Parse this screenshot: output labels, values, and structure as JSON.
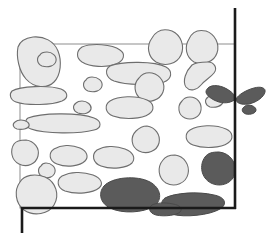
{
  "figure": {
    "canvas": {
      "width": 275,
      "height": 245,
      "background": "#ffffff"
    },
    "colors": {
      "clast_light_fill": "#e9e9e9",
      "clast_light_outline": "#6e6e6e",
      "clast_dark_fill": "#5b5b5b",
      "clast_dark_outline": "#4a4a4a",
      "frame_stroke": "#8d8d8d",
      "axis_stroke": "#1a1a1a"
    },
    "frame": {
      "label": "inner sample frame",
      "x": 20,
      "y": 44,
      "width": 215,
      "height": 164,
      "stroke_width": 1
    },
    "axes": [
      {
        "name": "vertical-axis-right",
        "orientation": "vertical",
        "x": 235,
        "y1": 8,
        "y2": 209,
        "stroke_width": 2.6
      },
      {
        "name": "horizontal-axis-bottom",
        "orientation": "horizontal",
        "y": 208,
        "x1": 21,
        "x2": 236,
        "stroke_width": 2.6
      },
      {
        "name": "vertical-axis-left-tail",
        "orientation": "vertical",
        "x": 22,
        "y1": 207,
        "y2": 233,
        "stroke_width": 2.6
      }
    ],
    "clasts": {
      "count_total": 31,
      "count_light": 25,
      "count_dark": 6,
      "light": [
        {
          "id": "clast-l01",
          "note": "large rounded, upper left, overlaps frame corner",
          "path": "M18,47 C16,57 19,71 26,79 C34,88 47,89 54,82 C61,75 62,61 58,51 C54,41 44,36 33,37 C25,38 20,41 18,47 Z"
        },
        {
          "id": "clast-l02",
          "note": "elongate oval upper centre-left",
          "path": "M82,47 C76,51 76,58 82,62 C90,67 106,68 116,64 C124,61 126,54 120,50 C112,44 92,43 82,47 Z"
        },
        {
          "id": "clast-l03",
          "note": "long bar, upper middle",
          "path": "M110,66 C104,70 106,78 114,81 C126,85 152,86 164,82 C172,79 173,71 166,67 C155,61 122,61 110,66 Z"
        },
        {
          "id": "clast-l04",
          "note": "round, top centre-right",
          "path": "M152,38 C146,46 148,57 156,62 C165,67 177,64 181,55 C185,46 181,35 172,31 C163,28 156,31 152,38 Z"
        },
        {
          "id": "clast-l05",
          "note": "round, top right",
          "path": "M189,39 C184,47 186,57 194,62 C203,66 214,62 217,53 C220,44 215,34 206,31 C197,29 192,32 189,39 Z"
        },
        {
          "id": "clast-l06",
          "note": "small pebble centre-left upper",
          "path": "M86,80 C82,83 83,89 88,91 C94,93 101,91 102,86 C103,81 98,77 92,77 C89,77 87,78 86,80 Z"
        },
        {
          "id": "clast-l07",
          "note": "wavy S-shape, right upper",
          "path": "M192,65 C186,71 182,81 186,87 C190,92 197,90 201,85 C205,80 210,78 214,73 C218,68 214,62 208,62 C203,62 196,62 192,65 Z"
        },
        {
          "id": "clast-l08",
          "note": "rounded, right of centre",
          "path": "M139,78 C133,84 134,94 141,99 C149,104 160,100 163,92 C166,84 161,75 152,73 C146,72 142,74 139,78 Z"
        },
        {
          "id": "clast-l09",
          "note": "flat lens left margin",
          "path": "M12,91 C9,94 10,100 16,102 C28,106 52,105 62,101 C69,98 68,92 61,89 C49,85 20,86 12,91 Z"
        },
        {
          "id": "clast-l10",
          "note": "oval, centre band",
          "path": "M110,101 C104,105 105,113 113,116 C124,120 142,119 149,114 C155,110 154,103 147,100 C136,95 118,96 110,101 Z"
        },
        {
          "id": "clast-l11",
          "note": "small round, right band",
          "path": "M182,101 C177,106 178,115 185,118 C192,121 200,117 201,110 C202,103 197,97 190,97 C186,97 184,98 182,101 Z"
        },
        {
          "id": "clast-l12",
          "note": "very long thin bar, left-centre",
          "path": "M28,118 C24,121 25,127 31,129 C45,134 79,134 94,130 C102,128 102,121 94,118 C78,112 40,113 28,118 Z"
        },
        {
          "id": "clast-l13",
          "note": "rounded blob, mid-right",
          "path": "M136,131 C130,137 131,147 139,151 C147,155 157,151 159,143 C161,135 155,127 147,126 C142,126 139,128 136,131 Z"
        },
        {
          "id": "clast-l14",
          "note": "elongate oval, right band",
          "path": "M190,130 C184,134 185,142 193,145 C204,149 221,148 228,143 C234,139 233,132 226,129 C215,124 198,125 190,130 Z"
        },
        {
          "id": "clast-l15",
          "note": "round, left-centre lower",
          "path": "M14,144 C10,150 11,160 19,164 C27,168 36,164 38,156 C40,148 34,141 26,140 C20,140 16,141 14,144 Z"
        },
        {
          "id": "clast-l16",
          "note": "oval, lower-left centre",
          "path": "M54,149 C48,153 49,161 57,164 C67,168 80,166 85,161 C89,157 87,151 80,148 C71,144 61,145 54,149 Z"
        },
        {
          "id": "clast-l17",
          "note": "oval, lower centre",
          "path": "M97,150 C91,155 93,163 101,166 C112,170 127,168 132,163 C136,158 133,152 125,149 C115,145 104,146 97,150 Z"
        },
        {
          "id": "clast-l18",
          "note": "small round, lower centre-left",
          "path": "M41,166 C37,169 38,175 43,177 C48,179 54,177 55,172 C56,167 51,163 46,163 C43,163 42,164 41,166 Z"
        },
        {
          "id": "clast-l19",
          "note": "long oval, lower-left",
          "path": "M62,176 C56,180 57,188 65,191 C77,195 93,193 99,188 C104,184 101,178 93,175 C82,171 70,172 62,176 Z"
        },
        {
          "id": "clast-l20",
          "note": "round, lower right of centre",
          "path": "M163,160 C157,167 158,178 166,183 C175,188 186,183 188,174 C190,165 184,156 175,155 C169,155 165,157 163,160 Z"
        },
        {
          "id": "clast-l21",
          "note": "large round, bottom-left overlapping axis corner",
          "path": "M20,182 C14,190 15,203 24,210 C34,217 49,214 54,205 C60,195 56,182 45,177 C35,173 24,175 20,182 Z"
        },
        {
          "id": "clast-l22",
          "note": "oval near top-left frame edge",
          "path": "M40,55 C36,58 37,64 42,66 C48,68 55,66 56,61 C57,56 52,52 47,52 C43,52 41,53 40,55 Z"
        },
        {
          "id": "clast-l23",
          "note": "small lens centre-left",
          "path": "M15,122 C12,124 13,128 17,129 C22,130 28,129 29,126 C30,123 26,120 21,120 C18,120 16,121 15,122 Z"
        },
        {
          "id": "clast-l24",
          "note": "small oval, right upper gap",
          "path": "M208,97 C204,100 205,105 210,107 C216,108 222,106 223,102 C224,98 219,95 214,95 C211,95 209,96 208,97 Z"
        },
        {
          "id": "clast-l25",
          "note": "small rounded, centre gap",
          "path": "M76,103 C72,106 73,111 78,113 C84,115 90,113 91,109 C92,105 87,101 82,101 C79,101 77,102 76,103 Z"
        }
      ],
      "dark": [
        {
          "id": "clast-d01",
          "note": "bowtie / butterfly straddling right axis",
          "path": "M208,88 C212,84 222,85 230,91 C234,94 236,97 235,99 C233,102 226,104 219,102 C212,100 206,95 206,92 C206,90 207,89 208,88 Z M236,99 C238,95 246,90 254,88 C261,86 266,88 265,92 C264,97 256,103 248,104 C241,105 236,103 236,99 Z"
        },
        {
          "id": "clast-d02",
          "note": "large blob bottom centre crossing axis",
          "path": "M104,186 C98,193 100,203 110,208 C122,214 144,213 154,206 C163,200 161,188 150,182 C137,175 112,177 104,186 Z"
        },
        {
          "id": "clast-d03",
          "note": "rounded blob right, above axis",
          "path": "M205,157 C199,165 201,178 211,183 C221,188 233,183 235,173 C237,163 230,153 219,152 C212,152 208,153 205,157 Z"
        },
        {
          "id": "clast-d04",
          "note": "elongate streak bottom right crossing axis",
          "path": "M165,198 C159,202 161,211 171,214 C185,218 210,215 220,209 C228,204 225,197 214,195 C198,191 174,193 165,198 Z"
        },
        {
          "id": "clast-d05",
          "note": "small dark lens, far right below bowtie",
          "path": "M244,107 C241,109 242,113 246,114 C251,115 256,113 256,110 C256,107 252,105 248,105 C246,105 245,106 244,107 Z"
        },
        {
          "id": "clast-d06",
          "note": "dark sliver bottom, left of streak",
          "path": "M152,205 C148,208 149,213 156,215 C165,217 177,215 180,212 C183,209 180,205 173,204 C164,202 156,203 152,205 Z"
        }
      ]
    }
  }
}
